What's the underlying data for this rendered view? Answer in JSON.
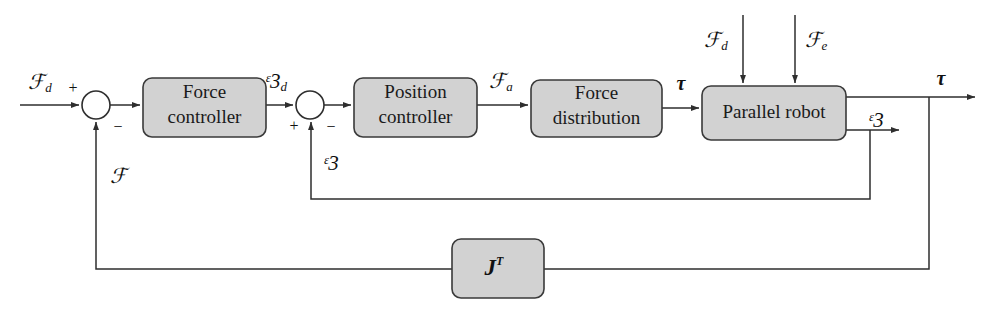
{
  "diagram": {
    "type": "control-block-diagram",
    "colors": {
      "block_fill": "#d2d2d2",
      "block_stroke": "#3a3a3a",
      "wire": "#2e2e2e",
      "background": "#ffffff"
    },
    "blocks": [
      {
        "id": "force-controller",
        "label_line1": "Force",
        "label_line2": "controller",
        "x": 143,
        "y": 78,
        "w": 123,
        "h": 59
      },
      {
        "id": "position-controller",
        "label_line1": "Position",
        "label_line2": "controller",
        "x": 354,
        "y": 78,
        "w": 123,
        "h": 59
      },
      {
        "id": "force-distribution",
        "label_line1": "Force",
        "label_line2": "distribution",
        "x": 531,
        "y": 80,
        "w": 131,
        "h": 57
      },
      {
        "id": "parallel-robot",
        "label_line1": "Parallel robot",
        "label_line2": "",
        "x": 702,
        "y": 86,
        "w": 144,
        "h": 54
      },
      {
        "id": "jacobian-transpose",
        "label_line1": "J",
        "label_line2": "T",
        "x": 452,
        "y": 239,
        "w": 92,
        "h": 59
      }
    ],
    "junctions": [
      {
        "id": "force-error-sum",
        "cx": 96,
        "cy": 105,
        "r": 14,
        "signs": [
          {
            "text": "+",
            "x": 73,
            "y": 89
          },
          {
            "text": "−",
            "x": 118,
            "y": 128
          }
        ]
      },
      {
        "id": "position-error-sum",
        "cx": 310,
        "cy": 105,
        "r": 14,
        "signs": [
          {
            "text": "+",
            "x": 294,
            "y": 127
          },
          {
            "text": "−",
            "x": 331,
            "y": 128
          }
        ]
      }
    ],
    "signals": [
      {
        "id": "desired-force-input",
        "base": "ℱ",
        "sub": "d",
        "x": 40,
        "y": 84
      },
      {
        "id": "desired-pose",
        "base": "ᵋ3",
        "sub": "d",
        "x": 276,
        "y": 83
      },
      {
        "id": "actuator-force",
        "base": "ℱ",
        "sub": "a",
        "x": 501,
        "y": 83
      },
      {
        "id": "disturbance-force",
        "base": "ℱ",
        "sub": "d",
        "x": 716,
        "y": 42
      },
      {
        "id": "environment-force",
        "base": "ℱ",
        "sub": "e",
        "x": 816,
        "y": 42
      },
      {
        "id": "torque-after-dist",
        "base": "τ",
        "sub": "",
        "x": 681,
        "y": 85
      },
      {
        "id": "torque-output",
        "base": "τ",
        "sub": "",
        "x": 941,
        "y": 80
      },
      {
        "id": "pose-output",
        "base": "ᵋ3",
        "sub": "",
        "x": 876,
        "y": 122
      },
      {
        "id": "pose-feedback",
        "base": "ᵋ3",
        "sub": "",
        "x": 331,
        "y": 165
      },
      {
        "id": "force-feedback",
        "base": "ℱ",
        "sub": "",
        "x": 118,
        "y": 178
      }
    ]
  }
}
